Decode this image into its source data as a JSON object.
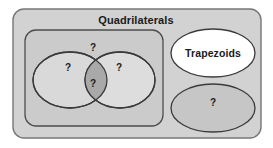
{
  "diagram": {
    "title": "Quadrilaterals",
    "type": "venn-diagram",
    "background_color": "#ffffff",
    "regions": [
      {
        "id": "universe",
        "shape": "rounded-rectangle",
        "label": "Quadrilaterals",
        "fill": "#d2d2d2",
        "stroke": "#6e6e6e"
      },
      {
        "id": "inner-group",
        "shape": "rounded-rectangle",
        "label": "",
        "fill": "#cbcbcb",
        "stroke": "#4a4a4a"
      },
      {
        "id": "left-ellipse",
        "shape": "ellipse",
        "label": "?",
        "fill": "#d8d8d8",
        "stroke": "#3c3c3c"
      },
      {
        "id": "right-ellipse",
        "shape": "ellipse",
        "label": "?",
        "fill": "#dcdcdc",
        "stroke": "#3c3c3c"
      },
      {
        "id": "intersection",
        "shape": "lens",
        "label": "?",
        "fill": "#a8a8a8",
        "stroke": "#3c3c3c"
      },
      {
        "id": "inner-group-outside",
        "shape": "region",
        "label": "?",
        "fill": "#cbcbcb",
        "stroke": "none"
      },
      {
        "id": "trapezoids-ellipse",
        "shape": "ellipse",
        "label": "Trapezoids",
        "fill": "#ffffff",
        "stroke": "#3c3c3c"
      },
      {
        "id": "unknown-ellipse",
        "shape": "ellipse",
        "label": "?",
        "fill": "#c6c6c6",
        "stroke": "#3c3c3c"
      }
    ],
    "labels": {
      "title": "Quadrilaterals",
      "trapezoids": "Trapezoids",
      "question_inner_top": "?",
      "question_left": "?",
      "question_right": "?",
      "question_intersection": "?",
      "question_lower_right": "?"
    }
  }
}
